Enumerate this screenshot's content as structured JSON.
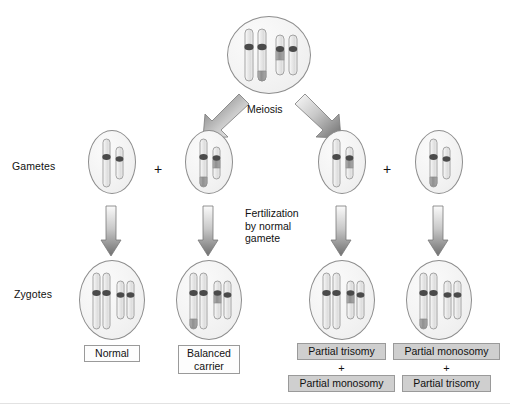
{
  "diagram": {
    "row_labels": {
      "gametes": "Gametes",
      "zygotes": "Zygotes"
    },
    "process_labels": {
      "meiosis": "Meiosis",
      "fertilization": "Fertilization\nby normal\ngamete"
    },
    "operators": {
      "plus": "+"
    },
    "colors": {
      "cell_outline": "#8d8d8d",
      "cell_fill": "#f2f2f2",
      "chromosome_outline": "#9a9a9a",
      "chromosome_fill": "#e6e6e6",
      "centromere": "#4a4a4a",
      "translocated_segment": "#8a8a8a",
      "arrow_dark": "#6b6b6b",
      "arrow_light": "#f2f2f2",
      "box_border": "#9a9a9a",
      "box_grey_fill": "#cfcfcf",
      "box_plain_fill": "#fdfdfd",
      "text": "#111111"
    },
    "parent_cell": {
      "name": "parent-cell",
      "chromosome_count": 4,
      "chromosomes": [
        {
          "id": "long-normal",
          "type": "long",
          "marked": false
        },
        {
          "id": "long-derivative",
          "type": "long",
          "marked": true,
          "mark_position": "distal-q"
        },
        {
          "id": "short-derivative",
          "type": "short",
          "marked": true,
          "mark_position": "proximal-q"
        },
        {
          "id": "short-normal",
          "type": "short",
          "marked": false
        }
      ]
    },
    "gametes": [
      {
        "index": 1,
        "name": "gamete-normal",
        "chromosomes": [
          {
            "id": "long-normal",
            "type": "long",
            "marked": false
          },
          {
            "id": "short-normal",
            "type": "short",
            "marked": false
          }
        ]
      },
      {
        "index": 2,
        "name": "gamete-balanced",
        "chromosomes": [
          {
            "id": "long-derivative",
            "type": "long",
            "marked": true,
            "mark_position": "distal-q"
          },
          {
            "id": "short-derivative",
            "type": "short",
            "marked": true,
            "mark_position": "proximal-q"
          }
        ]
      },
      {
        "index": 3,
        "name": "gamete-unbalanced-a",
        "chromosomes": [
          {
            "id": "long-normal",
            "type": "long",
            "marked": false
          },
          {
            "id": "short-derivative",
            "type": "short",
            "marked": true,
            "mark_position": "proximal-q"
          }
        ]
      },
      {
        "index": 4,
        "name": "gamete-unbalanced-b",
        "chromosomes": [
          {
            "id": "long-derivative",
            "type": "long",
            "marked": true,
            "mark_position": "distal-q"
          },
          {
            "id": "short-normal",
            "type": "short",
            "marked": false
          }
        ]
      }
    ],
    "zygotes": [
      {
        "index": 1,
        "name": "zygote-normal",
        "chromosomes": [
          {
            "id": "long-normal",
            "type": "long",
            "marked": false
          },
          {
            "id": "long-normal-2",
            "type": "long",
            "marked": false
          },
          {
            "id": "short-normal",
            "type": "short",
            "marked": false
          },
          {
            "id": "short-normal-2",
            "type": "short",
            "marked": false
          }
        ],
        "labels": [
          {
            "text": "Normal",
            "style": "plain"
          }
        ]
      },
      {
        "index": 2,
        "name": "zygote-balanced-carrier",
        "chromosomes": [
          {
            "id": "long-derivative",
            "type": "long",
            "marked": true,
            "mark_position": "distal-q"
          },
          {
            "id": "long-normal",
            "type": "long",
            "marked": false
          },
          {
            "id": "short-derivative",
            "type": "short",
            "marked": true,
            "mark_position": "proximal-q"
          },
          {
            "id": "short-normal",
            "type": "short",
            "marked": false
          }
        ],
        "labels": [
          {
            "text": "Balanced\ncarrier",
            "style": "plain"
          }
        ]
      },
      {
        "index": 3,
        "name": "zygote-partial-trisomy-monosomy",
        "chromosomes": [
          {
            "id": "long-normal",
            "type": "long",
            "marked": false
          },
          {
            "id": "long-normal-2",
            "type": "long",
            "marked": false
          },
          {
            "id": "short-derivative",
            "type": "short",
            "marked": true,
            "mark_position": "proximal-q"
          },
          {
            "id": "short-normal",
            "type": "short",
            "marked": false
          }
        ],
        "labels": [
          {
            "text": "Partial trisomy",
            "style": "grey"
          },
          {
            "text": "Partial monosomy",
            "style": "grey"
          }
        ]
      },
      {
        "index": 4,
        "name": "zygote-partial-monosomy-trisomy",
        "chromosomes": [
          {
            "id": "long-derivative",
            "type": "long",
            "marked": true,
            "mark_position": "distal-q"
          },
          {
            "id": "long-normal",
            "type": "long",
            "marked": false
          },
          {
            "id": "short-normal",
            "type": "short",
            "marked": false
          },
          {
            "id": "short-normal-2",
            "type": "short",
            "marked": false
          }
        ],
        "labels": [
          {
            "text": "Partial monosomy",
            "style": "grey"
          },
          {
            "text": "Partial trisomy",
            "style": "grey"
          }
        ]
      }
    ],
    "arrows": {
      "meiosis_left": "meiosis-arrow-left",
      "meiosis_right": "meiosis-arrow-right",
      "fertilization": [
        "fertilization-arrow-1",
        "fertilization-arrow-2",
        "fertilization-arrow-3",
        "fertilization-arrow-4"
      ]
    }
  }
}
